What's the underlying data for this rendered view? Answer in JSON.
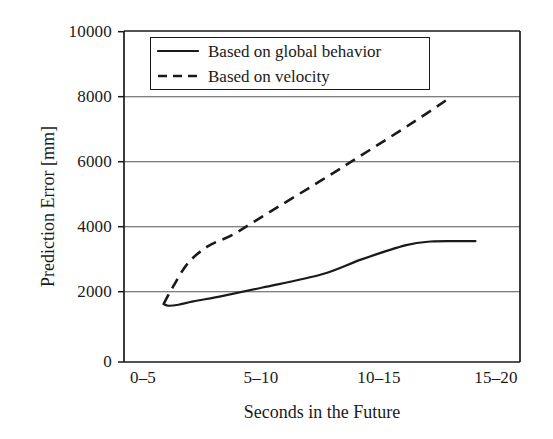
{
  "chart_data": {
    "type": "line",
    "title": "",
    "xlabel": "Seconds in the Future",
    "ylabel": "Prediction Error [mm]",
    "categories": [
      "0–5",
      "5–10",
      "10–15",
      "15–20"
    ],
    "x": [
      1,
      2,
      3,
      4
    ],
    "xlim": [
      0.6,
      4.6
    ],
    "ylim": [
      0,
      10000
    ],
    "yticks": [
      0,
      2000,
      4000,
      6000,
      8000,
      10000
    ],
    "ytick_labels": [
      "0",
      "2000",
      "4000",
      "6000",
      "8000",
      "10000"
    ],
    "grid": "horizontal",
    "legend_position": "upper-left-inside",
    "series": [
      {
        "name": "Based on global behavior",
        "style": "solid",
        "color": "#1a1a1a",
        "values": [
          1750,
          2250,
          3100,
          3650
        ],
        "points": [
          [
            1.0,
            1750
          ],
          [
            1.05,
            1700
          ],
          [
            1.15,
            1730
          ],
          [
            1.3,
            1830
          ],
          [
            1.6,
            2000
          ],
          [
            2.0,
            2250
          ],
          [
            2.6,
            2650
          ],
          [
            3.0,
            3100
          ],
          [
            3.45,
            3530
          ],
          [
            3.7,
            3640
          ],
          [
            4.0,
            3650
          ],
          [
            4.15,
            3650
          ]
        ]
      },
      {
        "name": "Based on velocity",
        "style": "dashed",
        "color": "#1a1a1a",
        "values": [
          1750,
          4150,
          6200,
          8000
        ],
        "points": [
          [
            1.0,
            1750
          ],
          [
            1.1,
            2300
          ],
          [
            1.25,
            3000
          ],
          [
            1.45,
            3500
          ],
          [
            1.7,
            3850
          ],
          [
            2.0,
            4400
          ],
          [
            2.6,
            5500
          ],
          [
            3.0,
            6250
          ],
          [
            3.5,
            7200
          ],
          [
            3.9,
            8000
          ]
        ]
      }
    ]
  },
  "axis": {
    "y_title": "Prediction Error [mm]",
    "x_title": "Seconds in the Future",
    "y_labels": [
      "10000",
      "8000",
      "6000",
      "4000",
      "2000",
      "0"
    ],
    "x_labels": [
      "0–5",
      "5–10",
      "10–15",
      "15–20"
    ]
  },
  "legend": {
    "entries": [
      {
        "label": "Based on global behavior",
        "style": "solid"
      },
      {
        "label": "Based on velocity",
        "style": "dashed"
      }
    ]
  },
  "colors": {
    "ink": "#1a1a1a",
    "grid": "#555555",
    "background": "#ffffff"
  }
}
